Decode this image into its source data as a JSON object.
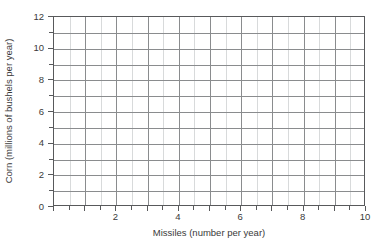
{
  "chart_data": {
    "type": "line",
    "title": "",
    "subtitle": "",
    "xlabel": "Missiles (number per year)",
    "ylabel": "Corn (millions of bushels per year)",
    "xlim": [
      0,
      10
    ],
    "ylim": [
      0,
      12
    ],
    "grid": true,
    "legend": null,
    "legend_position": "none",
    "series": [],
    "annotations": [],
    "note": "Blank coordinate grid - no data plotted",
    "x_ticklabels": [
      "2",
      "4",
      "6",
      "8",
      "10"
    ],
    "x_tickvalues": [
      2,
      4,
      6,
      8,
      10
    ],
    "x_minor_step": 0.5,
    "y_ticklabels": [
      "0",
      "2",
      "4",
      "6",
      "8",
      "10",
      "12"
    ],
    "y_tickvalues": [
      0,
      2,
      4,
      6,
      8,
      10,
      12
    ],
    "y_minor_step": 1,
    "colors": {
      "background": "#ffffff",
      "axis": "#58595b",
      "grid_major": "#8a8c8e",
      "grid_minor": "#d8dadb",
      "text": "#3a3a3a"
    }
  }
}
